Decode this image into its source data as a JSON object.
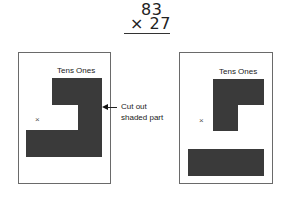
{
  "problem": {
    "multiplicand": "83",
    "multiplier_line": "× 27",
    "operator": "×",
    "multiplier": "27"
  },
  "left_panel": {
    "column_labels": "Tens Ones",
    "place_marker": "×",
    "annotation": {
      "line1": "Cut out",
      "line2": "shaded part"
    }
  },
  "right_panel": {
    "column_labels": "Tens Ones",
    "place_marker": "×"
  },
  "colors": {
    "shade": "#8c8c8c",
    "frame_border": "#6a6a6a",
    "text": "#222222"
  }
}
